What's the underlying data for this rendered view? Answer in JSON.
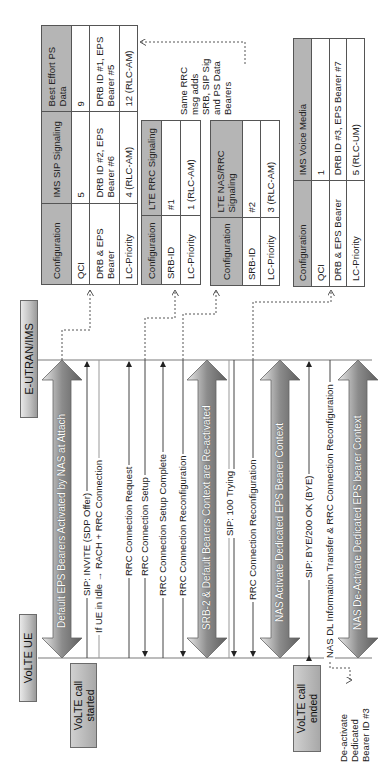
{
  "lifelines": {
    "ue": "VoLTE UE",
    "network": "E-UTRAN/IMS"
  },
  "events": {
    "call_started": "VoLTE call started",
    "call_ended": "VoLTE call ended"
  },
  "bearer_arrows": [
    {
      "label": "Default EPS Bearers Activated by NAS at Attach"
    },
    {
      "label": "SRB-2 & Default Bearers Context are Re-activated"
    },
    {
      "label": "NAS Activate Dedicated EPS Bearer Context"
    },
    {
      "label": "NAS De-Activate Dedicated EPS bearer Context"
    }
  ],
  "messages": [
    {
      "label": "SIP: INVITE (SDP Offer)",
      "direction": "UE->Network"
    },
    {
      "label": "If UE in Idle → RACH + RRC Connection",
      "direction": "none"
    },
    {
      "label": "RRC Connection Request",
      "direction": "UE->Network"
    },
    {
      "label": "RRC Connection Setup",
      "direction": "Network->UE"
    },
    {
      "label": "RRC Connection Setup Complete",
      "direction": "UE->Network"
    },
    {
      "label": "RRC Connection Reconfiguration",
      "direction": "Network->UE"
    },
    {
      "label": "SIP: 100 Trying",
      "direction": "Network->UE"
    },
    {
      "label": "RRC Connection Reconfiguration",
      "direction": "Network->UE"
    },
    {
      "label": "SIP: BYE/200 OK (BYE)",
      "direction": "both"
    },
    {
      "label": "NAS DL Information Transfer & RRC Connection Reconfiguration",
      "direction": "Network->UE"
    }
  ],
  "note": "Same RRC msg adds SRB, SIP Sig and PS Data Bearers",
  "side_note": "De-activate Dedicated Bearer ID #3",
  "tables": {
    "default_bearers": {
      "headers": [
        "Configuration",
        "IMS SIP Signaling",
        "Best Effort PS Data"
      ],
      "rows": [
        [
          "QCI",
          "5",
          "9"
        ],
        [
          "DRB & EPS Bearer",
          "DRB ID #2, EPS Bearer #6",
          "DRB ID #1, EPS Bearer #5"
        ],
        [
          "LC-Priority",
          "4 (RLC-AM)",
          "12 (RLC-AM)"
        ]
      ]
    },
    "lte_rrc": {
      "headers": [
        "Configuration",
        "LTE RRC Signaling"
      ],
      "rows": [
        [
          "SRB-ID",
          "#1"
        ],
        [
          "LC-Priority",
          "1 (RLC-AM)"
        ]
      ]
    },
    "lte_nas_rrc": {
      "headers": [
        "Configuration",
        "LTE NAS/RRC Signaling"
      ],
      "rows": [
        [
          "SRB-ID",
          "#2"
        ],
        [
          "LC-Priority",
          "3 (RLC-AM)"
        ]
      ]
    },
    "ims_voice": {
      "headers": [
        "Configuration",
        "IMS Voice Media"
      ],
      "rows": [
        [
          "QCI",
          "1"
        ],
        [
          "DRB & EPS Bearer",
          "DRB ID #3, EPS Bearer #7"
        ],
        [
          "LC-Priority",
          "5 (RLC-UM)"
        ]
      ]
    }
  },
  "colors": {
    "table_header": "#b5b5b5",
    "line": "#444444",
    "box_gradient_dark": "#9a9a9a"
  }
}
